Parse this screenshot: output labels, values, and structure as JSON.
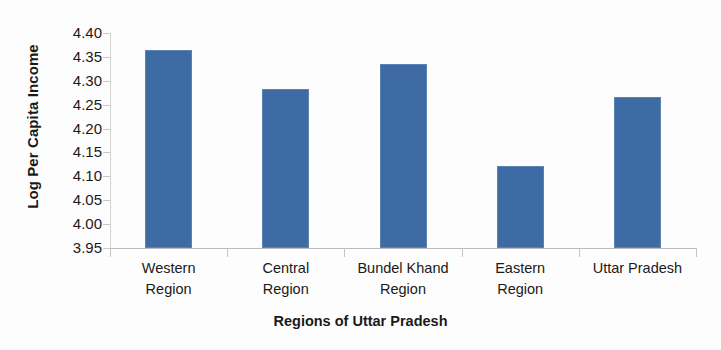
{
  "chart_data": {
    "type": "bar",
    "title": "",
    "xlabel": "Regions of Uttar Pradesh",
    "ylabel": "Log Per Capita Income",
    "categories": [
      "Western Region",
      "Central Region",
      "Bundel Khand Region",
      "Eastern Region",
      "Uttar Pradesh"
    ],
    "category_lines": [
      [
        "Western",
        "Region"
      ],
      [
        "Central",
        "Region"
      ],
      [
        "Bundel Khand",
        "Region"
      ],
      [
        "Eastern",
        "Region"
      ],
      [
        "Uttar Pradesh",
        ""
      ]
    ],
    "values": [
      4.365,
      4.283,
      4.335,
      4.122,
      4.266
    ],
    "ylim": [
      3.95,
      4.4
    ],
    "ytick_labels": [
      "4.40",
      "4.35",
      "4.30",
      "4.25",
      "4.20",
      "4.15",
      "4.10",
      "4.05",
      "4.00",
      "3.95"
    ],
    "ytick_values": [
      4.4,
      4.35,
      4.3,
      4.25,
      4.2,
      4.15,
      4.1,
      4.05,
      4.0,
      3.95
    ],
    "grid": false,
    "legend": false,
    "bar_color": "#3f6ba4",
    "axis_color": "#bfbfbf",
    "text_color": "#1a1a1a",
    "background_color": "#fdfdfd"
  }
}
